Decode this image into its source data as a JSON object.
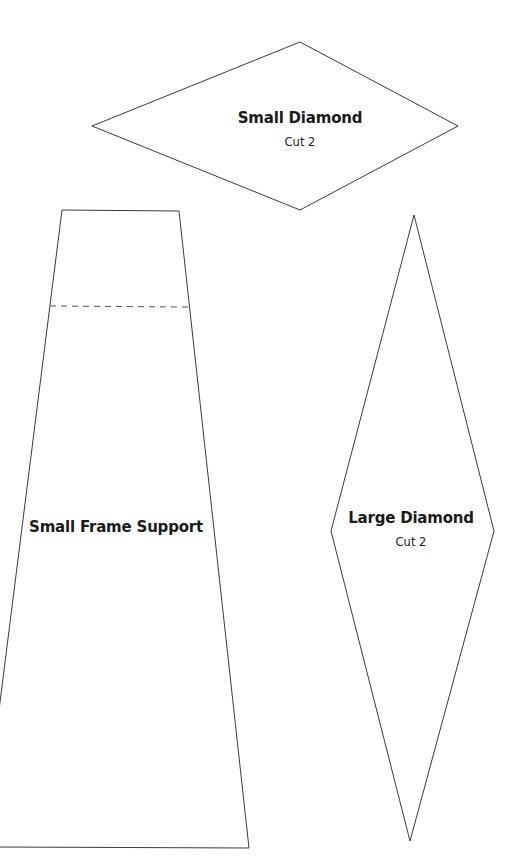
{
  "pieces": {
    "small_diamond": {
      "title": "Small Diamond",
      "instruction": "Cut 2"
    },
    "small_frame_support": {
      "title": "Small Frame Support"
    },
    "large_diamond": {
      "title": "Large Diamond",
      "instruction": "Cut 2"
    }
  },
  "colors": {
    "outline": "#3a3a3a",
    "fold_line": "#555555",
    "text": "#1a1a1a",
    "background": "#ffffff"
  }
}
